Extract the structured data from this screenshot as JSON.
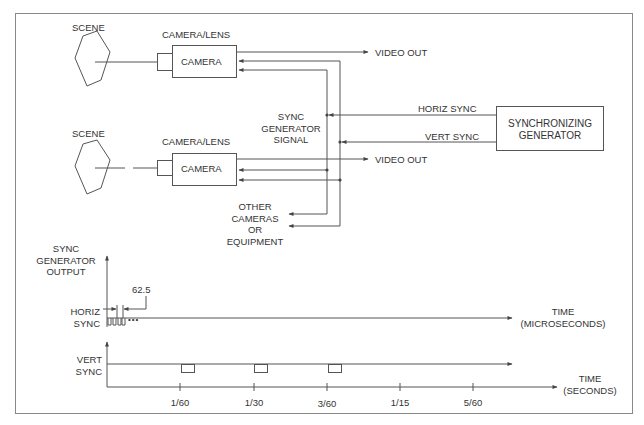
{
  "colors": {
    "line": "#555555",
    "text": "#333333",
    "frame": "#888888",
    "background": "#ffffff"
  },
  "diagram": {
    "top_camera": {
      "scene_label": "SCENE",
      "lens_label": "CAMERA/LENS",
      "box_label": "CAMERA",
      "output_label": "VIDEO OUT"
    },
    "bottom_camera": {
      "scene_label": "SCENE",
      "lens_label": "CAMERA/LENS",
      "box_label": "CAMERA",
      "output_label": "VIDEO OUT"
    },
    "bus_label": [
      "SYNC",
      "GENERATOR",
      "SIGNAL"
    ],
    "horiz_sync_label": "HORIZ SYNC",
    "vert_sync_label": "VERT SYNC",
    "generator_label": [
      "SYNCHRONIZING",
      "GENERATOR"
    ],
    "other_label": [
      "OTHER",
      "CAMERAS",
      "OR",
      "EQUIPMENT"
    ]
  },
  "timing": {
    "y_axis_label": [
      "SYNC",
      "GENERATOR",
      "OUTPUT"
    ],
    "horiz_label": [
      "HORIZ",
      "SYNC"
    ],
    "period_label": "62.5",
    "horiz_time_label": [
      "TIME",
      "(MICROSECONDS)"
    ],
    "vert_label": [
      "VERT",
      "SYNC"
    ],
    "vert_time_label": [
      "TIME",
      "(SECONDS)"
    ],
    "ticks": [
      "1/60",
      "1/30",
      "3/60",
      "1/15",
      "5/60"
    ],
    "continuation": "•••"
  }
}
